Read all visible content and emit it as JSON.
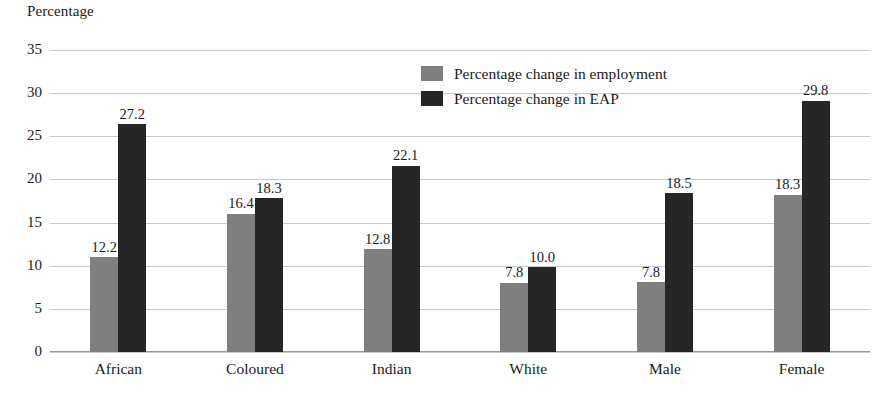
{
  "chart_data": {
    "type": "bar",
    "title": "",
    "ylabel": "Percentage",
    "xlabel": "",
    "ylim": [
      0,
      35
    ],
    "ytick_step": 5,
    "yticks": [
      "35",
      "30",
      "25",
      "20",
      "15",
      "10",
      "5",
      "0"
    ],
    "grid": true,
    "legend_position": "top-center",
    "categories": [
      "African",
      "Coloured",
      "Indian",
      "White",
      "Male",
      "Female"
    ],
    "series": [
      {
        "name": "Percentage change in employment",
        "color": "#7f7f7f",
        "values": [
          12.2,
          16.4,
          12.8,
          7.8,
          7.8,
          18.3
        ],
        "labels": [
          "12.2",
          "16.4",
          "12.8",
          "7.8",
          "7.8",
          "18.3"
        ],
        "drawn_values": [
          11.0,
          16.0,
          11.9,
          8.0,
          8.1,
          18.2
        ]
      },
      {
        "name": "Percentage change in EAP",
        "color": "#262626",
        "values": [
          27.2,
          18.3,
          22.1,
          10.0,
          18.5,
          29.8
        ],
        "labels": [
          "27.2",
          "18.3",
          "22.1",
          "10.0",
          "18.5",
          "29.8"
        ],
        "drawn_values": [
          26.4,
          17.8,
          21.6,
          9.8,
          18.4,
          29.1
        ]
      }
    ]
  },
  "legend": {
    "items": [
      {
        "label": "Percentage change in employment",
        "color": "#7f7f7f"
      },
      {
        "label": "Percentage change in EAP",
        "color": "#262626"
      }
    ]
  }
}
